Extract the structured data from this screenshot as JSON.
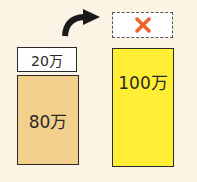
{
  "left": {
    "top_label": "20万",
    "main_label": "80万",
    "main_color": "#f2d08c"
  },
  "right": {
    "dashed_box_icon": "cross-icon",
    "dashed_box_icon_color": "#f0622a",
    "main_label": "100万",
    "main_color": "#ffee33"
  },
  "arrow": {
    "icon": "curved-arrow-right-icon"
  }
}
